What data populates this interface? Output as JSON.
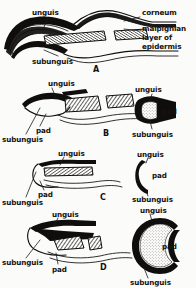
{
  "figure": {
    "background_color": "#fbfbfa",
    "ink_color": "#100e0c",
    "panels": [
      {
        "id": "A",
        "letter": "A",
        "kind": "claw-longitudinal-section",
        "labels": [
          {
            "key": "unguis",
            "text": "unguis"
          },
          {
            "key": "subunguis",
            "text": "subunguis"
          },
          {
            "key": "corneum",
            "text": "corneum"
          },
          {
            "key": "malpighian_1",
            "text": "malpighian"
          },
          {
            "key": "malpighian_2",
            "text": "layer of"
          },
          {
            "key": "malpighian_3",
            "text": "epidermis"
          }
        ]
      },
      {
        "id": "B",
        "letter": "B",
        "kind": "claw-lateral-and-cross-section",
        "labels_left": [
          {
            "key": "unguis",
            "text": "unguis"
          },
          {
            "key": "pad",
            "text": "pad"
          },
          {
            "key": "subunguis",
            "text": "subunguis"
          }
        ],
        "labels_right": [
          {
            "key": "unguis",
            "text": "unguis"
          },
          {
            "key": "pad",
            "text": "pad"
          },
          {
            "key": "subunguis",
            "text": "subunguis"
          }
        ]
      },
      {
        "id": "C",
        "letter": "C",
        "kind": "nail-lateral-and-cross-section",
        "labels_left": [
          {
            "key": "unguis",
            "text": "unguis"
          },
          {
            "key": "pad",
            "text": "pad"
          },
          {
            "key": "subunguis",
            "text": "subunguis"
          }
        ],
        "labels_right": [
          {
            "key": "unguis",
            "text": "unguis"
          },
          {
            "key": "pad",
            "text": "pad"
          },
          {
            "key": "subunguis",
            "text": "subunguis"
          }
        ]
      },
      {
        "id": "D",
        "letter": "D",
        "kind": "hoof-lateral-and-cross-section",
        "labels_left": [
          {
            "key": "unguis",
            "text": "unguis"
          },
          {
            "key": "subunguis",
            "text": "subunguis"
          },
          {
            "key": "pad",
            "text": "pad"
          }
        ],
        "labels_right": [
          {
            "key": "unguis",
            "text": "unguis"
          },
          {
            "key": "pad",
            "text": "pad"
          },
          {
            "key": "subunguis",
            "text": "subunguis"
          }
        ]
      }
    ]
  }
}
